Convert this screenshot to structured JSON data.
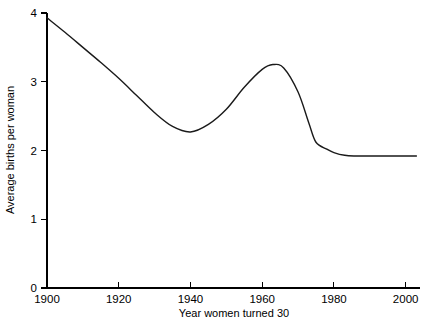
{
  "chart_data": {
    "type": "line",
    "title": "",
    "subtitle": "",
    "xlabel": "Year women turned 30",
    "ylabel": "Average births per woman",
    "xlim": [
      1900,
      2004
    ],
    "ylim": [
      0,
      4
    ],
    "grid": false,
    "legend": null,
    "legend_position": "none",
    "x_ticks": [
      1900,
      1920,
      1940,
      1960,
      1980,
      2000
    ],
    "x_tick_labels": [
      "1900",
      "1920",
      "1940",
      "1960",
      "1980",
      "2000"
    ],
    "y_ticks": [
      0,
      1,
      2,
      3,
      4
    ],
    "y_tick_labels": [
      "0",
      "1",
      "2",
      "3",
      "4"
    ],
    "line_color": "#1a1a1a",
    "series": [
      {
        "name": "Average births per woman",
        "x": [
          1900,
          1905,
          1910,
          1915,
          1920,
          1925,
          1930,
          1935,
          1940,
          1945,
          1950,
          1955,
          1960,
          1963,
          1966,
          1970,
          1973,
          1975,
          1978,
          1980,
          1983,
          1986,
          1990,
          1995,
          2000,
          2003
        ],
        "values": [
          3.93,
          3.72,
          3.5,
          3.28,
          3.05,
          2.8,
          2.55,
          2.35,
          2.27,
          2.38,
          2.6,
          2.92,
          3.18,
          3.25,
          3.2,
          2.85,
          2.4,
          2.12,
          2.02,
          1.97,
          1.93,
          1.92,
          1.92,
          1.92,
          1.92,
          1.92
        ]
      }
    ]
  }
}
